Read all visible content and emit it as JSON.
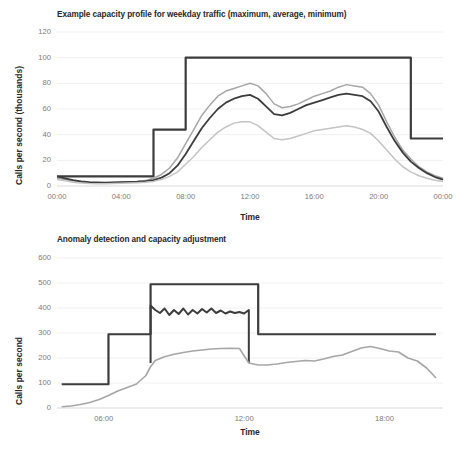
{
  "figure": {
    "width": 451,
    "height": 458,
    "background": "#ffffff",
    "series_colors": {
      "capacity": "#3c3c3c",
      "average": "#3c3c3c",
      "maximum": "#a6a6a6",
      "minimum": "#c4c4c4",
      "observed": "#a6a6a6",
      "grid": "#f0f0f0",
      "axis": "#d9d9d9",
      "tick_text": "#7a7a7a",
      "title_text": "#262626"
    }
  },
  "chart_data": [
    {
      "id": "top",
      "type": "line",
      "title": "Example capacity profile for weekday traffic (maximum, average, minimum)",
      "xlabel": "Time",
      "ylabel": "Calls per second (thousands)",
      "grid": true,
      "legend": "none",
      "xlim": [
        0,
        24
      ],
      "ylim": [
        0,
        120
      ],
      "yticks": [
        0,
        20,
        40,
        60,
        80,
        100,
        120
      ],
      "xticks": [
        0,
        4,
        8,
        12,
        16,
        20,
        24
      ],
      "xticklabels": [
        "00:00",
        "04:00",
        "08:00",
        "12:00",
        "16:00",
        "20:00",
        "00:00"
      ],
      "x": [
        0,
        0.5,
        1,
        1.5,
        2,
        2.5,
        3,
        3.5,
        4,
        4.5,
        5,
        5.5,
        6,
        6.5,
        7,
        7.5,
        8,
        8.5,
        9,
        9.5,
        10,
        10.5,
        11,
        11.5,
        12,
        12.5,
        13,
        13.5,
        14,
        14.5,
        15,
        15.5,
        16,
        16.5,
        17,
        17.5,
        18,
        18.5,
        19,
        19.5,
        20,
        20.5,
        21,
        21.5,
        22,
        22.5,
        23,
        23.5,
        24
      ],
      "series": [
        {
          "name": "capacity",
          "style": "step",
          "color": "#3c3c3c",
          "width": 2.2,
          "values": [
            7.5,
            7.5,
            7.5,
            7.5,
            7.5,
            7.5,
            7.5,
            7.5,
            7.5,
            7.5,
            7.5,
            7.5,
            44,
            44,
            44,
            44,
            100,
            100,
            100,
            100,
            100,
            100,
            100,
            100,
            100,
            100,
            100,
            100,
            100,
            100,
            100,
            100,
            100,
            100,
            100,
            100,
            100,
            100,
            100,
            100,
            100,
            100,
            100,
            100,
            37,
            37,
            37,
            37,
            37
          ]
        },
        {
          "name": "maximum",
          "style": "line",
          "color": "#a6a6a6",
          "width": 1.5,
          "values": [
            6,
            5,
            4,
            3.2,
            2.8,
            2.6,
            2.6,
            2.8,
            3,
            3.2,
            3.5,
            4.2,
            6,
            9,
            14,
            22,
            33,
            44,
            55,
            63,
            70,
            74,
            76,
            78,
            80,
            78,
            72,
            64,
            61,
            62,
            64,
            67,
            70,
            72,
            74,
            77,
            79,
            78,
            77,
            72,
            63,
            50,
            38,
            28,
            21,
            15,
            11,
            8,
            6
          ]
        },
        {
          "name": "average",
          "style": "line",
          "color": "#3c3c3c",
          "width": 1.8,
          "values": [
            7.5,
            6,
            4.5,
            3.6,
            3.0,
            2.8,
            2.7,
            2.8,
            3,
            3.2,
            3.4,
            3.8,
            4.6,
            6.5,
            10,
            16,
            25,
            35,
            45,
            53,
            60,
            65,
            68,
            70,
            71,
            68,
            62,
            56,
            55,
            57,
            60,
            63,
            65,
            67,
            69,
            71,
            72,
            71,
            70,
            66,
            58,
            46,
            35,
            26,
            19,
            14,
            10,
            7,
            5
          ]
        },
        {
          "name": "minimum",
          "style": "line",
          "color": "#c4c4c4",
          "width": 1.5,
          "values": [
            5,
            4,
            3,
            2.4,
            2.0,
            1.8,
            1.8,
            2.0,
            2.2,
            2.4,
            2.6,
            3.0,
            3.6,
            5,
            7.5,
            11,
            17,
            23,
            30,
            36,
            42,
            46,
            49,
            50,
            50,
            47,
            42,
            37,
            36,
            37,
            39,
            41,
            43,
            44,
            45,
            46,
            47,
            46,
            44,
            41,
            35,
            28,
            21,
            15,
            11,
            8,
            6,
            4.5,
            3.5
          ]
        }
      ]
    },
    {
      "id": "bottom",
      "type": "line",
      "title": "Anomaly detection and capacity adjustment",
      "xlabel": "Time",
      "ylabel": "Calls per second",
      "grid": true,
      "legend": "none",
      "xlim": [
        4.0,
        20.5
      ],
      "ylim": [
        0,
        600
      ],
      "yticks": [
        0,
        100,
        200,
        300,
        400,
        500,
        600
      ],
      "xticks": [
        6,
        12,
        18
      ],
      "xticklabels": [
        "06:00",
        "12:00",
        "18:00"
      ],
      "x": [
        4.2,
        4.6,
        5.0,
        5.4,
        5.8,
        6.2,
        6.6,
        7.0,
        7.4,
        7.8,
        8.0,
        8.2,
        8.6,
        9.0,
        9.4,
        9.8,
        10.2,
        10.6,
        11.0,
        11.4,
        11.8,
        12.2,
        12.6,
        13.0,
        13.4,
        13.8,
        14.2,
        14.6,
        15.0,
        15.4,
        15.8,
        16.2,
        16.6,
        17.0,
        17.4,
        17.8,
        18.2,
        18.6,
        19.0,
        19.4,
        19.8,
        20.2
      ],
      "series": [
        {
          "name": "capacity",
          "style": "step",
          "color": "#3c3c3c",
          "width": 2.2,
          "values": [
            95,
            95,
            95,
            95,
            95,
            295,
            295,
            295,
            295,
            295,
            495,
            495,
            495,
            495,
            495,
            495,
            495,
            495,
            495,
            495,
            495,
            495,
            295,
            295,
            295,
            295,
            295,
            295,
            295,
            295,
            295,
            295,
            295,
            295,
            295,
            295,
            295,
            295,
            295,
            295,
            295,
            295
          ]
        },
        {
          "name": "anomaly-burst",
          "style": "jagged",
          "color": "#3c3c3c",
          "width": 2.0,
          "x_start": 8.0,
          "x_end": 12.2,
          "base": 180,
          "values": [
            410,
            392,
            380,
            398,
            372,
            392,
            376,
            398,
            374,
            392,
            378,
            396,
            382,
            398,
            380,
            390,
            378,
            386,
            380,
            384,
            378,
            392
          ]
        },
        {
          "name": "observed",
          "style": "line",
          "color": "#a6a6a6",
          "width": 1.6,
          "values": [
            5,
            8,
            14,
            22,
            34,
            50,
            68,
            82,
            96,
            130,
            165,
            190,
            205,
            215,
            222,
            228,
            232,
            236,
            238,
            239,
            238,
            180,
            172,
            172,
            176,
            182,
            186,
            190,
            188,
            196,
            206,
            212,
            226,
            240,
            246,
            238,
            228,
            224,
            200,
            188,
            160,
            120
          ]
        }
      ]
    }
  ],
  "layout": {
    "top": {
      "plot_left": 57,
      "plot_top": 32,
      "plot_right": 443,
      "plot_bottom": 186
    },
    "bottom": {
      "plot_left": 57,
      "plot_top": 258,
      "plot_right": 443,
      "plot_bottom": 408
    }
  }
}
